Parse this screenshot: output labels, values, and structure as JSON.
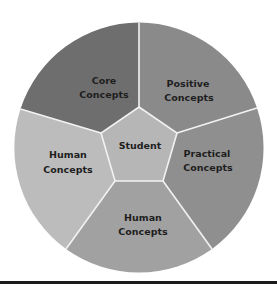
{
  "diagram": {
    "type": "circular-segmented-model",
    "center_label": "Student",
    "segments": [
      {
        "id": "core",
        "line1": "Core",
        "line2": "Concepts",
        "color": "#6e6e6e"
      },
      {
        "id": "positive",
        "line1": "Positive",
        "line2": "Concepts",
        "color": "#8a8a8a"
      },
      {
        "id": "practical",
        "line1": "Practical",
        "line2": "Concepts",
        "color": "#8f8f8f"
      },
      {
        "id": "human-bottom",
        "line1": "Human",
        "line2": "Concepts",
        "color": "#a1a1a1"
      },
      {
        "id": "human-left",
        "line1": "Human",
        "line2": "Concepts",
        "color": "#bcbcbc"
      }
    ],
    "center_color": "#b6b6b6",
    "divider_color": "#f2f2f2"
  }
}
